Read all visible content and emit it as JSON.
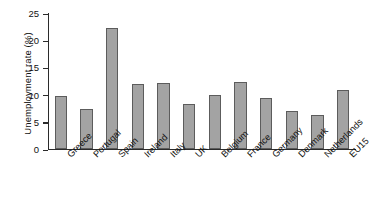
{
  "chart_data": {
    "type": "bar",
    "title": "",
    "xlabel": "",
    "ylabel": "Unemployment rate (%)",
    "categories": [
      "Greece",
      "Portugal",
      "Spain",
      "Ireland",
      "Italy",
      "UK",
      "Belgium",
      "France",
      "Germany",
      "Denmark",
      "Netherlands",
      "EU15"
    ],
    "values": [
      9.8,
      7.3,
      22.2,
      12.0,
      12.2,
      8.2,
      10.0,
      12.4,
      9.3,
      7.0,
      6.3,
      10.9
    ],
    "ylim": [
      0,
      25
    ],
    "yticks": [
      0,
      5,
      10,
      15,
      20,
      25
    ],
    "ytick_labels": [
      "0",
      "5",
      "10",
      "15",
      "20",
      "25"
    ],
    "grid": false,
    "legend": false,
    "bar_color": "#a3a3a3",
    "bar_edge_color": "#5c5c5c",
    "axis_color": "#2b2b2b"
  }
}
